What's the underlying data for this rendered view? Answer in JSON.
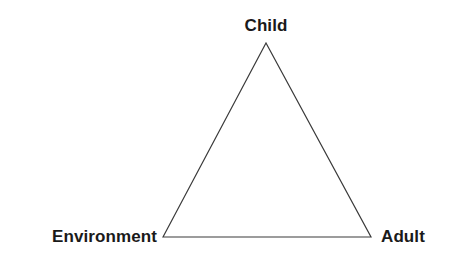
{
  "figure": {
    "type": "triangle-diagram",
    "background_color": "#ffffff",
    "width": 453,
    "height": 254
  },
  "style": {
    "stroke_color": "#3a3a3a",
    "stroke_width": 1.2,
    "label_color": "#1a1a1a",
    "label_font_size_px": 17,
    "label_font_weight": "bold"
  },
  "chart_data": {
    "type": "diagram",
    "shape": "triangle",
    "title": "",
    "nodes": [
      {
        "id": "child",
        "label": "Child",
        "x": 266,
        "y": 43,
        "position": "apex",
        "label_anchor": "center"
      },
      {
        "id": "environment",
        "label": "Environment",
        "x": 163,
        "y": 237,
        "position": "bottom-left",
        "label_anchor": "right"
      },
      {
        "id": "adult",
        "label": "Adult",
        "x": 371,
        "y": 237,
        "position": "bottom-right",
        "label_anchor": "left"
      }
    ],
    "edges": [
      {
        "from": "environment",
        "to": "child"
      },
      {
        "from": "child",
        "to": "adult"
      },
      {
        "from": "adult",
        "to": "environment"
      }
    ],
    "polygon_points": "163,237 266,43 371,237"
  },
  "labels": {
    "child": "Child",
    "environment": "Environment",
    "adult": "Adult"
  }
}
